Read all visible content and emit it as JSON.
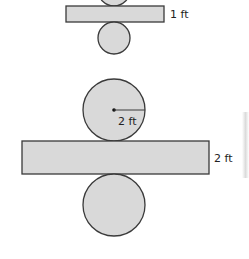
{
  "figure": {
    "colors": {
      "fill": "#d9d9d9",
      "stroke": "#3a3a3a",
      "text": "#222222"
    },
    "small_cylinder_net": {
      "rect_height_label": "1 ft",
      "top_circle": "partially cropped",
      "bottom_circle": "full"
    },
    "large_cylinder_net": {
      "radius_label": "2 ft",
      "rect_height_label": "2 ft"
    }
  }
}
